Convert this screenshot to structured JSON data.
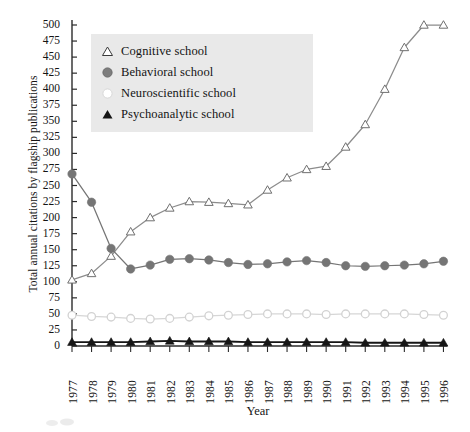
{
  "chart_data": {
    "type": "line",
    "title": "",
    "xlabel": "Year",
    "ylabel": "Total annual citations by flagship publications",
    "xlim": [
      1977,
      1996
    ],
    "ylim": [
      0,
      500
    ],
    "ytick_step": 25,
    "grid": false,
    "legend_position": "upper-left-inside",
    "categories": [
      1977,
      1978,
      1979,
      1980,
      1981,
      1982,
      1983,
      1984,
      1985,
      1986,
      1987,
      1988,
      1989,
      1990,
      1991,
      1992,
      1993,
      1994,
      1995,
      1996
    ],
    "xtick_labels": [
      "1977",
      "1978",
      "1979",
      "1980",
      "1981",
      "1982",
      "1983",
      "1984",
      "1985",
      "1986",
      "1987",
      "1988",
      "1989",
      "1990",
      "1991",
      "1992",
      "1993",
      "1994",
      "1995",
      "1996"
    ],
    "ytick_labels": [
      "500",
      "475",
      "450",
      "425",
      "400",
      "375",
      "350",
      "325",
      "300",
      "275",
      "250",
      "225",
      "200",
      "175",
      "150",
      "125",
      "100",
      "75",
      "50",
      "25",
      "0"
    ],
    "series": [
      {
        "name": "Cognitive school",
        "marker": "open-triangle",
        "color": "#8c8c8c",
        "values": [
          103,
          113,
          140,
          178,
          200,
          215,
          225,
          224,
          222,
          220,
          243,
          262,
          275,
          280,
          310,
          345,
          400,
          465,
          500,
          500
        ]
      },
      {
        "name": "Behavioral school",
        "marker": "filled-circle",
        "color": "#757575",
        "values": [
          268,
          224,
          152,
          120,
          126,
          135,
          136,
          134,
          130,
          127,
          128,
          131,
          133,
          130,
          125,
          124,
          125,
          126,
          128,
          132
        ]
      },
      {
        "name": "Neuroscientific school",
        "marker": "open-circle",
        "color": "#d6d6d6",
        "values": [
          48,
          46,
          45,
          43,
          42,
          43,
          45,
          47,
          48,
          49,
          50,
          50,
          50,
          49,
          50,
          50,
          50,
          50,
          49,
          48
        ]
      },
      {
        "name": "Psychoanalytic school",
        "marker": "filled-triangle",
        "color": "#161616",
        "values": [
          6,
          6,
          6,
          6,
          7,
          8,
          7,
          7,
          7,
          6,
          6,
          6,
          6,
          6,
          6,
          5,
          5,
          5,
          5,
          5
        ]
      }
    ]
  },
  "legend": {
    "items": [
      {
        "label": "Cognitive school",
        "marker": "open-triangle-icon"
      },
      {
        "label": "Behavioral school",
        "marker": "filled-circle-icon"
      },
      {
        "label": "Neuroscientific school",
        "marker": "open-circle-icon"
      },
      {
        "label": "Psychoanalytic school",
        "marker": "filled-triangle-icon"
      }
    ]
  },
  "axes": {
    "x_title": "Year",
    "y_title": "Total annual citations by flagship publications"
  },
  "colors": {
    "axis": "#2b2b2b",
    "legend_background": "#e9e9e9",
    "cognitive": "#8c8c8c",
    "behavioral": "#757575",
    "neuroscientific": "#d6d6d6",
    "psychoanalytic": "#161616"
  }
}
